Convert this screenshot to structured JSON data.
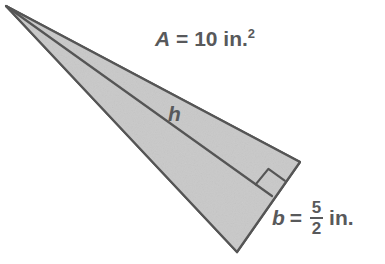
{
  "figure": {
    "type": "triangle-area-diagram",
    "background_color": "#ffffff",
    "fill_color": "#c9c9c9",
    "stroke_color": "#555555",
    "text_color": "#58595b",
    "stroke_width": 2.2,
    "vertices": {
      "apex": [
        6,
        6
      ],
      "top_right": [
        300,
        162
      ],
      "bottom": [
        237,
        252
      ]
    },
    "altitude": {
      "from": [
        6,
        6
      ],
      "foot": [
        272,
        196
      ]
    },
    "right_angle_marker": {
      "present": true,
      "size": 20
    }
  },
  "labels": {
    "area": {
      "variable": "A",
      "equals": "=",
      "value": "10",
      "unit": "in.",
      "exponent": "2",
      "full_text": "A = 10 in.2"
    },
    "height": {
      "variable": "h"
    },
    "base": {
      "variable": "b",
      "equals": "=",
      "numerator": "5",
      "denominator": "2",
      "unit": "in.",
      "full_text": "b = 5/2 in."
    }
  }
}
